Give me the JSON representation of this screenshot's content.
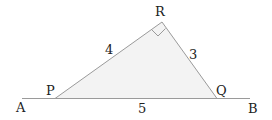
{
  "diagram": {
    "type": "right-triangle on line",
    "points": {
      "A": "A",
      "B": "B",
      "P": "P",
      "Q": "Q",
      "R": "R"
    },
    "side_labels": {
      "PR": "4",
      "RQ": "3",
      "PQ": "5"
    },
    "right_angle_at": "R",
    "colors": {
      "line": "#9a9a9a",
      "fill": "#f3f3f3",
      "text": "#222222"
    }
  }
}
